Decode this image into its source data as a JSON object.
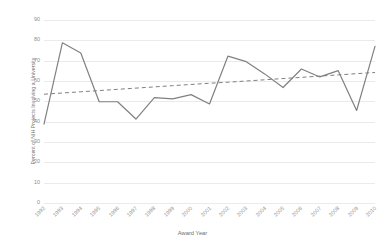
{
  "chart_data": {
    "type": "line",
    "title": "",
    "xlabel": "Award Year",
    "ylabel": "Percent of NIH Projects Involving a University",
    "categories": [
      "1992",
      "1993",
      "1994",
      "1995",
      "1996",
      "1997",
      "1998",
      "1999",
      "2000",
      "2001",
      "2002",
      "2003",
      "2004",
      "2005",
      "2006",
      "2007",
      "2008",
      "2009",
      "2010"
    ],
    "yticks": [
      0,
      10,
      20,
      30,
      40,
      50,
      60,
      70,
      80,
      90
    ],
    "ylim": [
      0,
      90
    ],
    "grid": true,
    "legend": "none",
    "series": [
      {
        "name": "Percent of NIH Projects Involving a University",
        "style": "solid",
        "color": "#808080",
        "values": [
          38.8,
          78.8,
          73.8,
          49.8,
          49.8,
          41.3,
          51.8,
          51.2,
          53.3,
          48.7,
          72.2,
          69.5,
          63.5,
          56.8,
          65.9,
          62.0,
          65.1,
          45.5,
          77.0
        ]
      },
      {
        "name": "Linear trendline",
        "style": "dashed",
        "color": "#808080",
        "values": [
          53.5,
          54.1,
          54.7,
          55.3,
          55.9,
          56.5,
          57.1,
          57.7,
          58.3,
          58.9,
          59.4,
          60.0,
          60.6,
          61.2,
          61.8,
          62.4,
          63.0,
          63.6,
          64.2
        ]
      }
    ]
  },
  "colors": {
    "line": "#808080",
    "trendline": "#8a8a8a",
    "grid": "#eaeaea",
    "text": "#8d8d8d",
    "axis_title": "#6f6f6f",
    "background": "#ffffff"
  }
}
